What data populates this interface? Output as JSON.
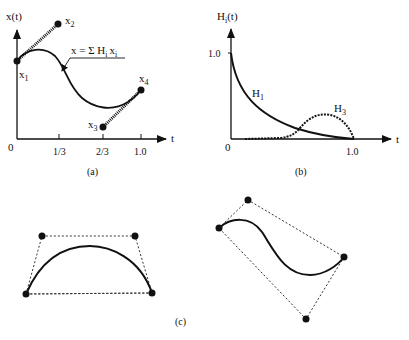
{
  "panel_a": {
    "caption": "(a)",
    "y_axis_label": "x(t)",
    "x_axis_label": "t",
    "origin_label": "0",
    "x_ticks": [
      "1/3",
      "2/3",
      "1.0"
    ],
    "formula": "x = Σ H",
    "formula_sub_i": "i",
    "formula_x": "x",
    "formula_sub_i2": "i",
    "points": [
      {
        "name": "x",
        "sub": "1"
      },
      {
        "name": "x",
        "sub": "2"
      },
      {
        "name": "x",
        "sub": "3"
      },
      {
        "name": "x",
        "sub": "4"
      }
    ]
  },
  "panel_b": {
    "caption": "(b)",
    "y_axis_label": "H",
    "y_axis_sub": "i",
    "y_axis_suffix": "(t)",
    "x_axis_label": "t",
    "origin_label": "0",
    "y_tick": "1.0",
    "x_tick": "1.0",
    "curves": [
      {
        "name": "H",
        "sub": "1",
        "style": "solid"
      },
      {
        "name": "H",
        "sub": "3",
        "style": "dashed"
      }
    ]
  },
  "panel_c": {
    "caption": "(c)"
  },
  "colors": {
    "ink": "#111111",
    "background": "#ffffff"
  }
}
